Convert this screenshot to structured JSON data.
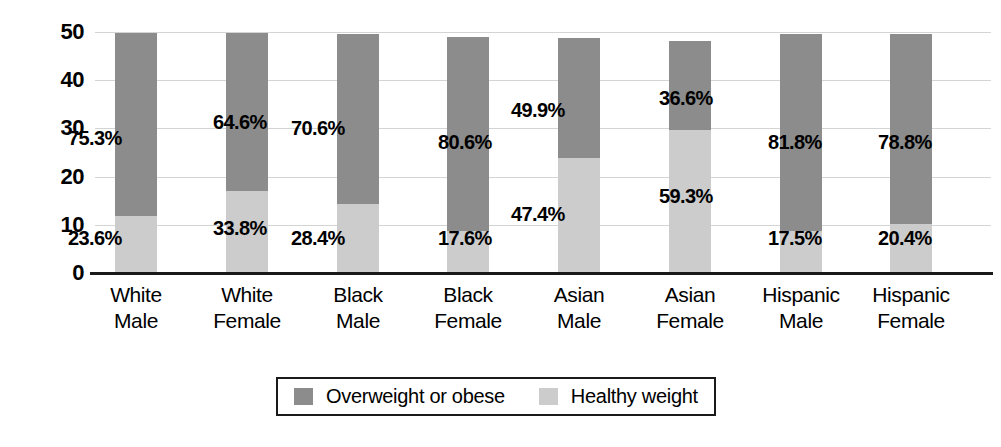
{
  "chart_data": {
    "type": "bar",
    "subtype": "stacked-bar-100",
    "title": "",
    "xlabel": "",
    "ylabel": "Percentage",
    "ylim": [
      0,
      50
    ],
    "yticks": [
      0,
      10,
      20,
      30,
      40,
      50
    ],
    "ytick_labels": [
      "0",
      "10",
      "20",
      "30",
      "40",
      "50"
    ],
    "grid": true,
    "legend_position": "bottom-center",
    "categories": [
      "White Male",
      "White Female",
      "Black Male",
      "Black Female",
      "Asian Male",
      "Asian Female",
      "Hispanic Male",
      "Hispanic Female"
    ],
    "category_lines": [
      [
        "White",
        "Male"
      ],
      [
        "White",
        "Female"
      ],
      [
        "Black",
        "Male"
      ],
      [
        "Black",
        "Female"
      ],
      [
        "Asian",
        "Male"
      ],
      [
        "Asian",
        "Female"
      ],
      [
        "Hispanic",
        "Male"
      ],
      [
        "Hispanic",
        "Female"
      ]
    ],
    "series": [
      {
        "name": "Overweight or obese",
        "color": "#8c8c8c",
        "values": [
          75.3,
          64.6,
          70.6,
          80.6,
          49.9,
          36.6,
          81.8,
          78.8
        ],
        "labels": [
          "75.3%",
          "64.6%",
          "70.6%",
          "80.6%",
          "49.9%",
          "36.6%",
          "81.8%",
          "78.8%"
        ]
      },
      {
        "name": "Healthy weight",
        "color": "#cccccc",
        "values": [
          23.6,
          33.8,
          28.4,
          17.6,
          47.4,
          59.3,
          17.5,
          20.4
        ],
        "labels": [
          "23.6%",
          "33.8%",
          "28.4%",
          "17.6%",
          "47.4%",
          "59.3%",
          "17.5%",
          "20.4%"
        ]
      }
    ],
    "bar_totals": [
      49.7,
      49.7,
      49.6,
      48.9,
      48.8,
      48.1,
      49.6,
      49.6
    ]
  },
  "legend": {
    "items": [
      {
        "label": "Overweight or obese",
        "swatch_color": "#8c8c8c"
      },
      {
        "label": "Healthy weight",
        "swatch_color": "#cccccc"
      }
    ]
  },
  "colors": {
    "overweight": "#8c8c8c",
    "healthy": "#cccccc",
    "axis": "#1a1a1a",
    "grid": "#d4d4d4",
    "background": "#ffffff"
  }
}
